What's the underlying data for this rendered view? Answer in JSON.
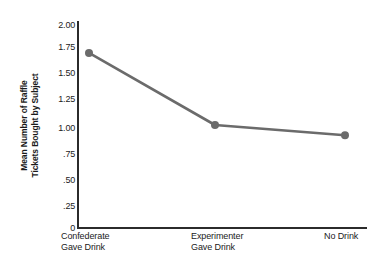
{
  "chart_data": {
    "type": "line",
    "title": "",
    "xlabel": "",
    "ylabel": "Mean Number of Raffle Tickets Bought by Subject",
    "ylabel_line1": "Mean Number of Raffle",
    "ylabel_line2": "Tickets Bought by Subject",
    "categories": [
      "Confederate Gave Drink",
      "Experimenter Gave Drink",
      "No Drink"
    ],
    "category_lines": [
      {
        "line1": "Confederate",
        "line2": "Gave Drink"
      },
      {
        "line1": "Experimenter",
        "line2": "Gave Drink"
      },
      {
        "line1": "No Drink",
        "line2": ""
      }
    ],
    "values": [
      1.7,
      1.0,
      0.9
    ],
    "ylim": [
      0,
      2.0
    ],
    "yticks": [
      0,
      0.25,
      0.5,
      0.75,
      1.0,
      1.25,
      1.5,
      1.75,
      2.0
    ],
    "ytick_labels": [
      "0",
      ".25",
      ".50",
      ".75",
      "1.00",
      "1.25",
      "1.50",
      "1.75",
      "2.00"
    ],
    "grid": false,
    "legend": "none",
    "series_color": "#6b6b6b",
    "axis_color": "#2b2b2b",
    "marker": "circle",
    "marker_size": 8,
    "line_width": 2.6,
    "background_color": "#ffffff"
  },
  "axis_labels": {
    "y": [
      {
        "value": "2.00"
      },
      {
        "value": "1.75"
      },
      {
        "value": "1.50"
      },
      {
        "value": "1.25"
      },
      {
        "value": "1.00"
      },
      {
        "value": ".75"
      },
      {
        "value": ".50"
      },
      {
        "value": ".25"
      },
      {
        "value": "0"
      }
    ]
  }
}
